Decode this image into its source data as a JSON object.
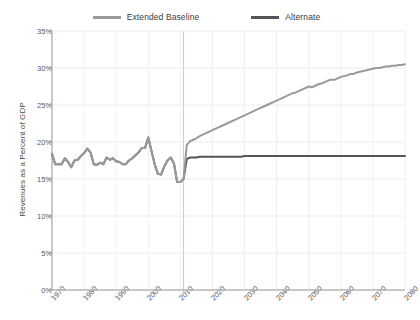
{
  "chart_data": {
    "type": "line",
    "title": "",
    "xlabel": "",
    "ylabel": "Revenues as a Percent of GDP",
    "xlim": [
      1970,
      2080
    ],
    "ylim": [
      0,
      35
    ],
    "ytick_labels": [
      "35%",
      "30%",
      "25%",
      "20%",
      "15%",
      "10%",
      "5%",
      "0%"
    ],
    "ytick_values": [
      35,
      30,
      25,
      20,
      15,
      10,
      5,
      0
    ],
    "xtick_labels": [
      "1970",
      "1980",
      "1990",
      "2000",
      "2010",
      "2020",
      "2030",
      "2040",
      "2050",
      "2060",
      "2070",
      "2080"
    ],
    "xtick_values": [
      1970,
      1980,
      1990,
      2000,
      2010,
      2020,
      2030,
      2040,
      2050,
      2060,
      2070,
      2080
    ],
    "grid": true,
    "legend_position": "top-center",
    "projection_divider_x": 2011,
    "series": [
      {
        "name": "Extended Baseline",
        "color": "#9a9a9a",
        "x": [
          1970,
          1971,
          1972,
          1973,
          1974,
          1975,
          1976,
          1977,
          1978,
          1979,
          1980,
          1981,
          1982,
          1983,
          1984,
          1985,
          1986,
          1987,
          1988,
          1989,
          1990,
          1991,
          1992,
          1993,
          1994,
          1995,
          1996,
          1997,
          1998,
          1999,
          2000,
          2001,
          2002,
          2003,
          2004,
          2005,
          2006,
          2007,
          2008,
          2009,
          2010,
          2011,
          2012,
          2013,
          2014,
          2015,
          2016,
          2017,
          2018,
          2019,
          2020,
          2021,
          2022,
          2023,
          2024,
          2025,
          2026,
          2027,
          2028,
          2029,
          2030,
          2031,
          2032,
          2033,
          2034,
          2035,
          2036,
          2037,
          2038,
          2039,
          2040,
          2041,
          2042,
          2043,
          2044,
          2045,
          2046,
          2047,
          2048,
          2049,
          2050,
          2051,
          2052,
          2053,
          2054,
          2055,
          2056,
          2057,
          2058,
          2059,
          2060,
          2061,
          2062,
          2063,
          2064,
          2065,
          2066,
          2067,
          2068,
          2069,
          2070,
          2071,
          2072,
          2073,
          2074,
          2075,
          2076,
          2077,
          2078,
          2079,
          2080
        ],
        "values": [
          18.4,
          17.0,
          17.0,
          17.0,
          17.8,
          17.3,
          16.6,
          17.5,
          17.6,
          18.1,
          18.5,
          19.1,
          18.6,
          17.0,
          16.9,
          17.2,
          17.0,
          17.9,
          17.6,
          17.8,
          17.4,
          17.3,
          17.0,
          17.0,
          17.5,
          17.8,
          18.2,
          18.6,
          19.2,
          19.2,
          20.6,
          18.8,
          17.0,
          15.7,
          15.6,
          16.7,
          17.5,
          17.9,
          17.1,
          14.6,
          14.6,
          15.0,
          19.6,
          20.1,
          20.3,
          20.5,
          20.8,
          21.0,
          21.2,
          21.4,
          21.6,
          21.8,
          22.0,
          22.2,
          22.4,
          22.6,
          22.8,
          23.0,
          23.2,
          23.4,
          23.6,
          23.8,
          24.0,
          24.2,
          24.4,
          24.6,
          24.8,
          25.0,
          25.2,
          25.4,
          25.6,
          25.8,
          26.0,
          26.2,
          26.4,
          26.6,
          26.7,
          26.9,
          27.1,
          27.3,
          27.5,
          27.4,
          27.6,
          27.8,
          27.9,
          28.1,
          28.3,
          28.4,
          28.4,
          28.6,
          28.8,
          28.9,
          29.0,
          29.2,
          29.2,
          29.4,
          29.5,
          29.6,
          29.7,
          29.8,
          29.9,
          30.0,
          30.0,
          30.1,
          30.2,
          30.2,
          30.3,
          30.3,
          30.4,
          30.4,
          30.5
        ]
      },
      {
        "name": "Alternate",
        "color": "#555555",
        "x": [
          1970,
          1971,
          1972,
          1973,
          1974,
          1975,
          1976,
          1977,
          1978,
          1979,
          1980,
          1981,
          1982,
          1983,
          1984,
          1985,
          1986,
          1987,
          1988,
          1989,
          1990,
          1991,
          1992,
          1993,
          1994,
          1995,
          1996,
          1997,
          1998,
          1999,
          2000,
          2001,
          2002,
          2003,
          2004,
          2005,
          2006,
          2007,
          2008,
          2009,
          2010,
          2011,
          2012,
          2013,
          2014,
          2015,
          2016,
          2017,
          2018,
          2019,
          2020,
          2021,
          2022,
          2023,
          2024,
          2025,
          2026,
          2027,
          2028,
          2029,
          2030,
          2031,
          2032,
          2033,
          2034,
          2035,
          2036,
          2037,
          2038,
          2039,
          2040,
          2041,
          2042,
          2043,
          2044,
          2045,
          2046,
          2047,
          2048,
          2049,
          2050,
          2051,
          2052,
          2053,
          2054,
          2055,
          2056,
          2057,
          2058,
          2059,
          2060,
          2061,
          2062,
          2063,
          2064,
          2065,
          2066,
          2067,
          2068,
          2069,
          2070,
          2071,
          2072,
          2073,
          2074,
          2075,
          2076,
          2077,
          2078,
          2079,
          2080
        ],
        "values": [
          18.4,
          17.0,
          17.0,
          17.0,
          17.8,
          17.3,
          16.6,
          17.5,
          17.6,
          18.1,
          18.5,
          19.1,
          18.6,
          17.0,
          16.9,
          17.2,
          17.0,
          17.9,
          17.6,
          17.8,
          17.4,
          17.3,
          17.0,
          17.0,
          17.5,
          17.8,
          18.2,
          18.6,
          19.2,
          19.2,
          20.6,
          18.8,
          17.0,
          15.7,
          15.6,
          16.7,
          17.5,
          17.9,
          17.1,
          14.6,
          14.6,
          15.0,
          17.7,
          17.9,
          17.9,
          17.9,
          18.0,
          18.0,
          18.0,
          18.0,
          18.0,
          18.0,
          18.0,
          18.0,
          18.0,
          18.0,
          18.0,
          18.0,
          18.0,
          18.0,
          18.1,
          18.1,
          18.1,
          18.1,
          18.1,
          18.1,
          18.1,
          18.1,
          18.1,
          18.1,
          18.1,
          18.1,
          18.1,
          18.1,
          18.1,
          18.1,
          18.1,
          18.1,
          18.1,
          18.1,
          18.1,
          18.1,
          18.1,
          18.1,
          18.1,
          18.1,
          18.1,
          18.1,
          18.1,
          18.1,
          18.1,
          18.1,
          18.1,
          18.1,
          18.1,
          18.1,
          18.1,
          18.1,
          18.1,
          18.1,
          18.1,
          18.1,
          18.1,
          18.1,
          18.1,
          18.1,
          18.1,
          18.1,
          18.1,
          18.1,
          18.1
        ]
      }
    ]
  },
  "legend": {
    "items": [
      {
        "label": "Extended Baseline",
        "color": "#9a9a9a"
      },
      {
        "label": "Alternate",
        "color": "#555555"
      }
    ]
  },
  "axes": {
    "y_title": "Revenues as a Percent of GDP"
  }
}
